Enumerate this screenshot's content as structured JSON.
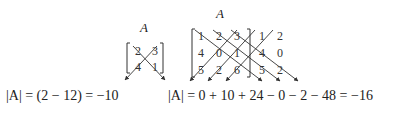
{
  "left": {
    "matrix_label": "A",
    "matrix": [
      [
        "2",
        "3"
      ],
      [
        "4",
        "1"
      ]
    ],
    "equation": "|A| = (2 − 12) = −10"
  },
  "right": {
    "matrix_label": "A",
    "matrix": [
      [
        "1",
        "2",
        "3"
      ],
      [
        "4",
        "0",
        "1"
      ],
      [
        "5",
        "2",
        "6"
      ]
    ],
    "extended_columns": [
      [
        "1",
        "2"
      ],
      [
        "4",
        "0"
      ],
      [
        "5",
        "2"
      ]
    ],
    "equation": "|A| = 0 + 10 + 24 − 0 − 2 − 48 = −16"
  }
}
